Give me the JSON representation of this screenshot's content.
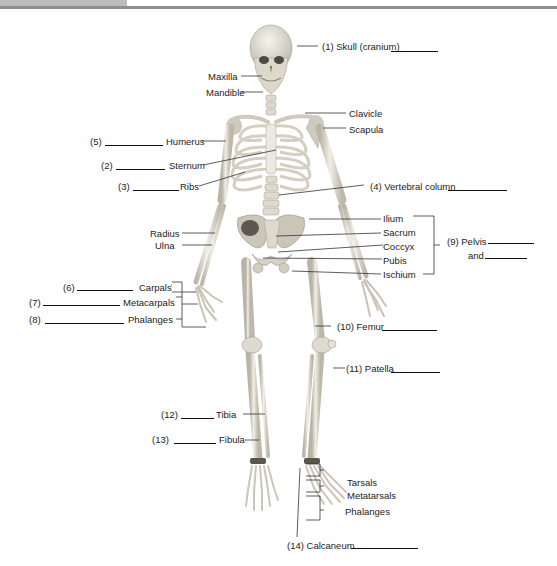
{
  "figure": {
    "colors": {
      "bone": "#e9e6dc",
      "bone_shade": "#b9b4a6",
      "leader_line": "#333333",
      "top_rule": "#8e8e8e",
      "top_tab": "#bdbdbd"
    }
  },
  "labels": {
    "skull": {
      "number": "(1)",
      "text": "Skull (cranium)"
    },
    "maxilla": {
      "text": "Maxilla"
    },
    "mandible": {
      "text": "Mandible"
    },
    "clavicle": {
      "text": "Clavicle"
    },
    "scapula": {
      "text": "Scapula"
    },
    "humerus": {
      "number": "(5)",
      "text": "Humerus"
    },
    "sternum": {
      "number": "(2)",
      "text": "Sternum"
    },
    "ribs": {
      "number": "(3)",
      "text": "Ribs"
    },
    "vertebral_column": {
      "number": "(4)",
      "text": "Vertebral column"
    },
    "radius": {
      "text": "Radius"
    },
    "ulna": {
      "text": "Ulna"
    },
    "ilium": {
      "text": "Ilium"
    },
    "sacrum": {
      "text": "Sacrum"
    },
    "coccyx": {
      "text": "Coccyx"
    },
    "pubis": {
      "text": "Pubis"
    },
    "ischium": {
      "text": "Ischium"
    },
    "pelvis": {
      "number": "(9)",
      "text": "Pelvis",
      "and_text": "and"
    },
    "carpals": {
      "number": "(6)",
      "text": "Carpals"
    },
    "metacarpals": {
      "number": "(7)",
      "text": "Metacarpals"
    },
    "phalanges_hand": {
      "number": "(8)",
      "text": "Phalanges"
    },
    "femur": {
      "number": "(10)",
      "text": "Femur"
    },
    "patella": {
      "number": "(11)",
      "text": "Patella"
    },
    "tibia": {
      "number": "(12)",
      "text": "Tibia"
    },
    "fibula": {
      "number": "(13)",
      "text": "Fibula"
    },
    "tarsals": {
      "text": "Tarsals"
    },
    "metatarsals": {
      "text": "Metatarsals"
    },
    "phalanges_foot": {
      "text": "Phalanges"
    },
    "calcaneum": {
      "number": "(14)",
      "text": "Calcaneum"
    }
  }
}
